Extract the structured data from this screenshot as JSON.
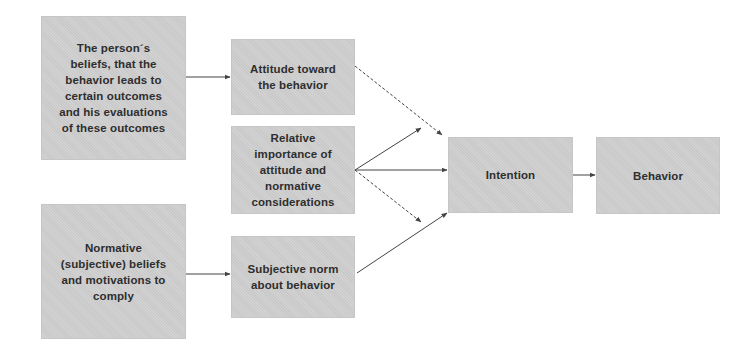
{
  "diagram": {
    "colors": {
      "box_fill": "#cfcfcf",
      "text": "#2e2e2e",
      "arrow": "#444444",
      "background": "#ffffff"
    },
    "nodes": {
      "beliefs_outcomes": {
        "label": "The person´s\nbeliefs, that the\nbehavior leads to\ncertain outcomes\nand his evaluations\nof these outcomes"
      },
      "attitude": {
        "label": "Attitude toward\nthe behavior"
      },
      "relative_importance": {
        "label": "Relative\nimportance of\nattitude and\nnormative\nconsiderations"
      },
      "normative_beliefs": {
        "label": "Normative\n(subjective) beliefs\nand motivations to\ncomply"
      },
      "subjective_norm": {
        "label": "Subjective norm\nabout behavior"
      },
      "intention": {
        "label": "Intention"
      },
      "behavior": {
        "label": "Behavior"
      }
    },
    "edges": [
      {
        "from": "beliefs_outcomes",
        "to": "attitude",
        "style": "solid"
      },
      {
        "from": "normative_beliefs",
        "to": "subjective_norm",
        "style": "solid"
      },
      {
        "from": "attitude",
        "to": "intention",
        "style": "dashed"
      },
      {
        "from": "relative_importance",
        "to": "attitude-to-intention-edge",
        "style": "solid"
      },
      {
        "from": "relative_importance",
        "to": "intention",
        "style": "solid"
      },
      {
        "from": "relative_importance",
        "to": "norm-to-intention-edge",
        "style": "solid"
      },
      {
        "from": "subjective_norm",
        "to": "intention",
        "style": "dashed"
      },
      {
        "from": "intention",
        "to": "behavior",
        "style": "solid"
      }
    ]
  }
}
